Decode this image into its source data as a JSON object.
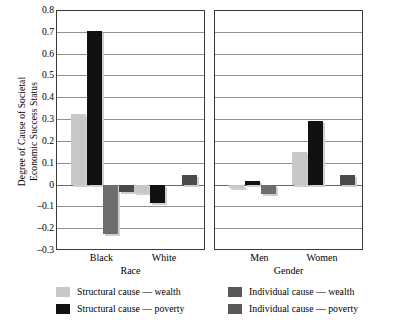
{
  "chart_data": {
    "type": "bar",
    "title": "",
    "xlabel": "",
    "ylabel": "Degree of Cause of Societal Economic Success Status",
    "ylabel_line1": "Degree of Cause of Societal",
    "ylabel_line2": "Economic Success Status",
    "ylim": [
      -0.3,
      0.8
    ],
    "ytick_step": 0.1,
    "yticks": [
      "0.8",
      "0.7",
      "0.6",
      "0.5",
      "0.4",
      "0.3",
      "0.2",
      "0.1",
      "0",
      "-0.1",
      "-0.2",
      "-0.3"
    ],
    "ytick_values": [
      0.8,
      0.7,
      0.6,
      0.5,
      0.4,
      0.3,
      0.2,
      0.1,
      0,
      -0.1,
      -0.2,
      -0.3
    ],
    "grid": true,
    "grid_axis": "y",
    "legend_position": "bottom",
    "panels": [
      {
        "name": "Race",
        "axis_label": "Race",
        "categories": [
          "Black",
          "White"
        ]
      },
      {
        "name": "Gender",
        "axis_label": "Gender",
        "categories": [
          "Men",
          "Women"
        ]
      }
    ],
    "categories": [
      "Black",
      "White",
      "Men",
      "Women"
    ],
    "series": [
      {
        "name": "Structural cause — wealth",
        "color": "#c8c8c8",
        "values": [
          0.325,
          -0.04,
          -0.015,
          0.15
        ]
      },
      {
        "name": "Structural cause — poverty",
        "color": "#111111",
        "values": [
          0.705,
          -0.085,
          0.015,
          0.29
        ]
      },
      {
        "name": "Individual cause — wealth",
        "color": "#6e6e6e",
        "values": [
          -0.225,
          0.0,
          -0.045,
          0.0
        ]
      },
      {
        "name": "Individual cause — poverty",
        "color": "#4a4a4a",
        "values": [
          -0.035,
          0.045,
          0.0,
          0.045
        ]
      }
    ]
  },
  "legend": {
    "items": [
      {
        "label": "Structural cause — wealth",
        "color": "#c8c8c8"
      },
      {
        "label": "Individual cause — wealth",
        "color": "#585858"
      },
      {
        "label": "Structural cause — poverty",
        "color": "#111111"
      },
      {
        "label": "Individual cause — poverty",
        "color": "#585858"
      }
    ]
  }
}
